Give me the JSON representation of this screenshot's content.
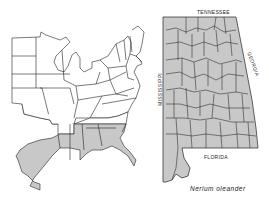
{
  "figure": {
    "species_caption": "Nerium oleander",
    "colors": {
      "background": "#ffffff",
      "shaded": "#c8c8c8",
      "border": "#222222"
    }
  },
  "us_map": {
    "title": "Eastern United States range",
    "shaded_states": [
      "Texas (coastal)",
      "Louisiana",
      "Mississippi",
      "Alabama",
      "Georgia",
      "South Carolina",
      "Florida"
    ]
  },
  "state_map": {
    "state": "Alabama",
    "all_counties_shaded": true,
    "labels": {
      "north": "TENNESSEE",
      "east": "GEORGIA",
      "west": "MISSISSIPPI",
      "south": "FLORIDA"
    }
  }
}
